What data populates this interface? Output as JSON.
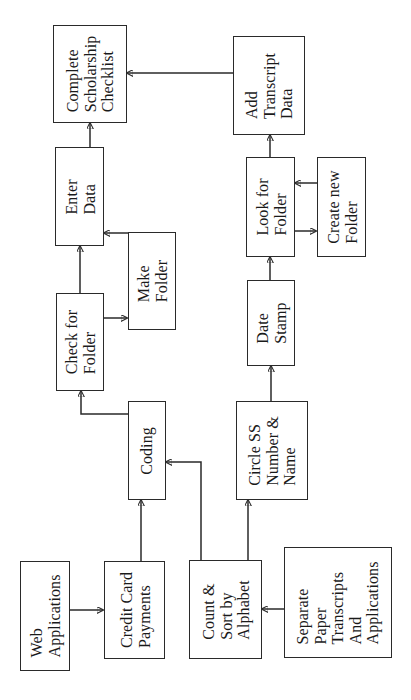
{
  "diagram": {
    "type": "flowchart",
    "orientation": "rotated-90-ccw",
    "colors": {
      "line": "#2a2a2a",
      "background": "#ffffff"
    },
    "nodes": {
      "web_applications": {
        "label": "Web\nApplications"
      },
      "credit_card_payments": {
        "label": "Credit Card\nPayments"
      },
      "count_sort": {
        "label": "Count &\nSort by\nAlphabet"
      },
      "separate_paper": {
        "label": "Separate\nPaper\nTranscripts\nAnd\nApplications"
      },
      "coding": {
        "label": "Coding"
      },
      "circle_ss": {
        "label": "Circle SS\nNumber &\nName"
      },
      "check_for_folder": {
        "label": "Check for\nFolder"
      },
      "make_folder": {
        "label": "Make\nFolder"
      },
      "enter_data": {
        "label": "Enter\nData"
      },
      "date_stamp": {
        "label": "Date\nStamp"
      },
      "look_for_folder": {
        "label": "Look for\nFolder"
      },
      "create_new_folder": {
        "label": "Create new\nFolder"
      },
      "add_transcript_data": {
        "label": "Add\nTranscript\nData"
      },
      "complete_checklist": {
        "label": "Complete\nScholarship\nChecklist"
      }
    },
    "edges": [
      {
        "from": "Web Applications",
        "to": "Credit Card Payments"
      },
      {
        "from": "Separate Paper Transcripts And Applications",
        "to": "Count & Sort by Alphabet"
      },
      {
        "from": "Credit Card Payments",
        "to": "Coding"
      },
      {
        "from": "Count & Sort by Alphabet",
        "to": "Coding"
      },
      {
        "from": "Count & Sort by Alphabet",
        "to": "Circle SS Number & Name"
      },
      {
        "from": "Coding",
        "to": "Check for Folder"
      },
      {
        "from": "Check for Folder",
        "to": "Make Folder"
      },
      {
        "from": "Check for Folder",
        "to": "Enter Data"
      },
      {
        "from": "Make Folder",
        "to": "Enter Data"
      },
      {
        "from": "Enter Data",
        "to": "Complete Scholarship Checklist"
      },
      {
        "from": "Circle SS Number & Name",
        "to": "Date Stamp"
      },
      {
        "from": "Date Stamp",
        "to": "Look for Folder"
      },
      {
        "from": "Look for Folder",
        "to": "Create new Folder"
      },
      {
        "from": "Create new Folder",
        "to": "Look for Folder"
      },
      {
        "from": "Look for Folder",
        "to": "Add Transcript Data"
      },
      {
        "from": "Add Transcript Data",
        "to": "Complete Scholarship Checklist"
      }
    ]
  }
}
